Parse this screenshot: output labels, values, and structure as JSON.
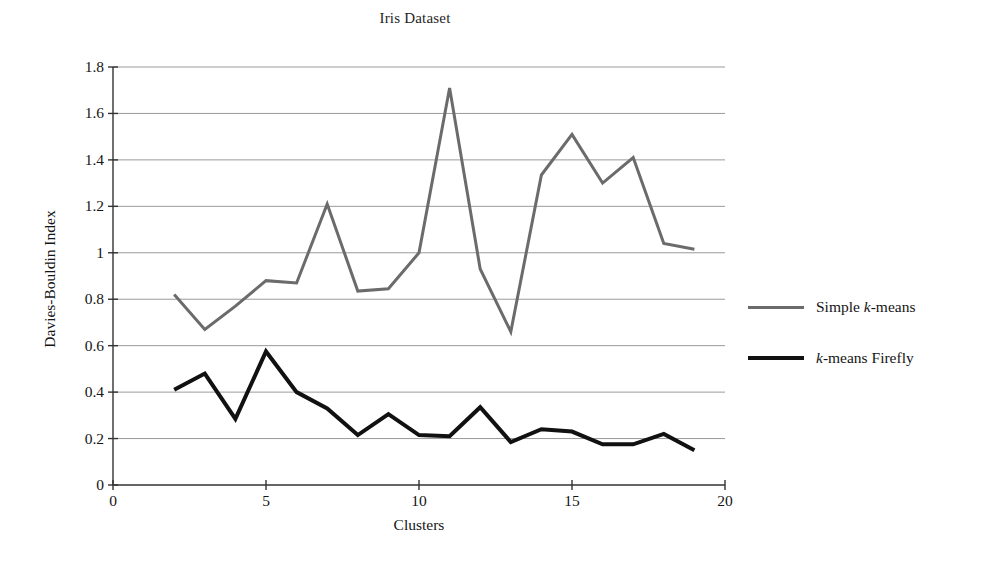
{
  "chart_data": {
    "type": "line",
    "title": "Iris Dataset",
    "xlabel": "Clusters",
    "ylabel": "Davies-Bouldin Index",
    "xlim": [
      0,
      20
    ],
    "ylim": [
      0,
      1.8
    ],
    "xticks": [
      "0",
      "5",
      "10",
      "15",
      "20"
    ],
    "xtick_values": [
      0,
      5,
      10,
      15,
      20
    ],
    "yticks": [
      "0",
      "0.2",
      "0.4",
      "0.6",
      "0.8",
      "1",
      "1.2",
      "1.4",
      "1.6",
      "1.8"
    ],
    "ytick_values": [
      0,
      0.2,
      0.4,
      0.6,
      0.8,
      1.0,
      1.2,
      1.4,
      1.6,
      1.8
    ],
    "grid": "horizontal",
    "legend_position": "right",
    "x": [
      2,
      3,
      4,
      5,
      6,
      7,
      8,
      9,
      10,
      11,
      12,
      13,
      14,
      15,
      16,
      17,
      18,
      19
    ],
    "series": [
      {
        "name": "Simple k-means",
        "name_prefix": "Simple ",
        "name_italic": "k",
        "name_suffix": "-means",
        "color": "#6b6b6b",
        "width": 3,
        "values": [
          0.82,
          0.67,
          0.77,
          0.88,
          0.87,
          1.21,
          0.835,
          0.845,
          1.0,
          1.71,
          0.93,
          0.66,
          1.335,
          1.51,
          1.3,
          1.41,
          1.04,
          1.015
        ]
      },
      {
        "name": "k-means Firefly",
        "name_prefix": "",
        "name_italic": "k",
        "name_suffix": "-means Firefly",
        "color": "#111111",
        "width": 4,
        "values": [
          0.41,
          0.48,
          0.285,
          0.575,
          0.4,
          0.33,
          0.215,
          0.305,
          0.215,
          0.21,
          0.335,
          0.185,
          0.24,
          0.23,
          0.175,
          0.175,
          0.22,
          0.15
        ]
      }
    ],
    "colors": {
      "axis": "#333333",
      "grid": "#9a9a9a",
      "background": "#ffffff",
      "text": "#151515"
    }
  }
}
